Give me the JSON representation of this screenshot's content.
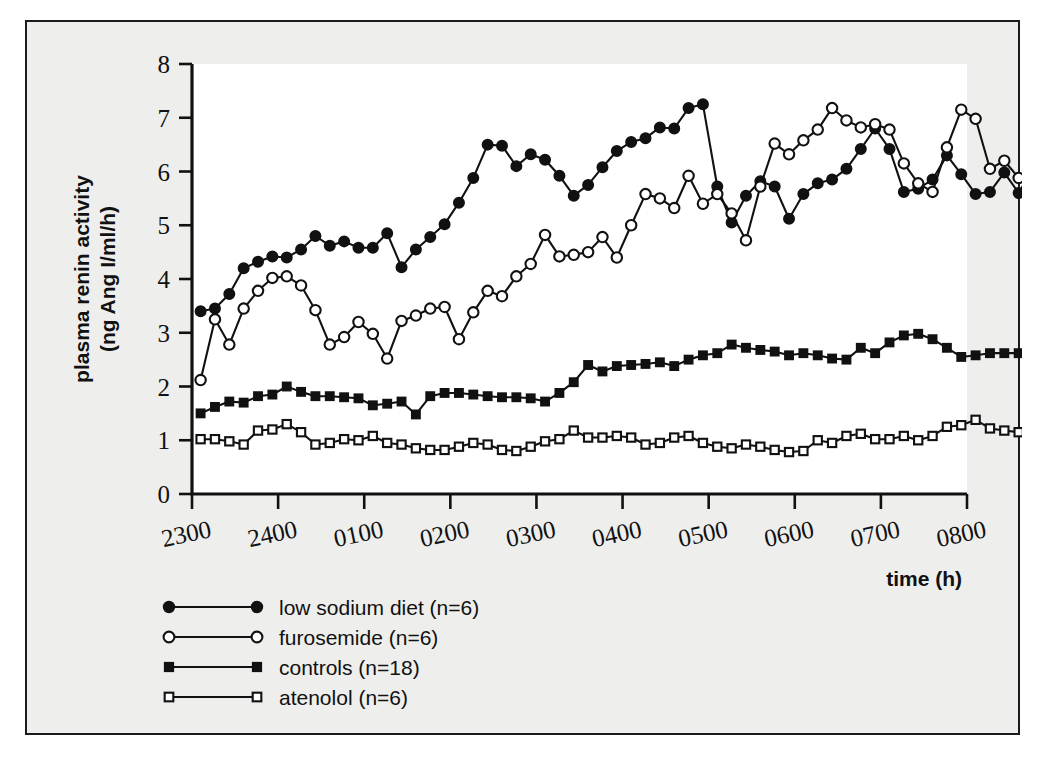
{
  "figure": {
    "background_color": "#eeeeec",
    "plot_background_color": "#ffffff",
    "border_color": "#1b1b1b",
    "ink_color": "#111111"
  },
  "chart_data": {
    "type": "line",
    "title": "",
    "xlabel": "time (h)",
    "ylabel": "plasma renin activity\n(ng Ang I/ml/h)",
    "ylabel_line1": "plasma renin activity",
    "ylabel_line2": "(ng Ang I/ml/h)",
    "grid": false,
    "legend_position": "below-left",
    "ylim": [
      0,
      8
    ],
    "yticks": [
      0,
      1,
      2,
      3,
      4,
      5,
      6,
      7,
      8
    ],
    "ytick_labels": [
      "0",
      "1",
      "2",
      "3",
      "4",
      "5",
      "6",
      "7",
      "8"
    ],
    "xlim_hours": [
      0,
      9
    ],
    "xticks_hours": [
      0,
      1,
      2,
      3,
      4,
      5,
      6,
      7,
      8,
      9
    ],
    "xtick_labels": [
      "2300",
      "2400",
      "0100",
      "0200",
      "0300",
      "0400",
      "0500",
      "0600",
      "0700",
      "0800"
    ],
    "x_sample_interval_minutes": 10,
    "x_start_hours": 0.1,
    "series": [
      {
        "name": "low sodium diet (n=6)",
        "marker": "filled-circle",
        "n": 6,
        "values": [
          3.4,
          3.45,
          3.72,
          4.2,
          4.32,
          4.42,
          4.4,
          4.55,
          4.8,
          4.62,
          4.7,
          4.58,
          4.58,
          4.85,
          4.22,
          4.55,
          4.78,
          5.02,
          5.42,
          5.88,
          6.5,
          6.48,
          6.1,
          6.32,
          6.22,
          5.92,
          5.55,
          5.75,
          6.08,
          6.38,
          6.55,
          6.62,
          6.82,
          6.8,
          7.18,
          7.25,
          5.72,
          5.05,
          5.55,
          5.82,
          5.72,
          5.12,
          5.58,
          5.78,
          5.85,
          6.05,
          6.42,
          6.8,
          6.42,
          5.62,
          5.68,
          5.85,
          6.3,
          5.95,
          5.58,
          5.62,
          5.98,
          5.6,
          6.05
        ]
      },
      {
        "name": "furosemide (n=6)",
        "marker": "open-circle",
        "n": 6,
        "values": [
          2.12,
          3.25,
          2.78,
          3.45,
          3.78,
          4.02,
          4.05,
          3.88,
          3.42,
          2.78,
          2.92,
          3.2,
          2.98,
          2.52,
          3.22,
          3.32,
          3.45,
          3.48,
          2.88,
          3.38,
          3.78,
          3.68,
          4.05,
          4.28,
          4.82,
          4.42,
          4.45,
          4.5,
          4.78,
          4.4,
          5.0,
          5.58,
          5.5,
          5.32,
          5.92,
          5.4,
          5.58,
          5.22,
          4.72,
          5.72,
          6.52,
          6.32,
          6.58,
          6.78,
          7.18,
          6.95,
          6.82,
          6.88,
          6.78,
          6.15,
          5.78,
          5.62,
          6.45,
          7.15,
          6.98,
          6.05,
          6.2,
          5.88,
          6.05
        ]
      },
      {
        "name": "controls (n=18)",
        "marker": "filled-square",
        "n": 18,
        "values": [
          1.5,
          1.62,
          1.72,
          1.7,
          1.82,
          1.85,
          2.0,
          1.9,
          1.82,
          1.82,
          1.8,
          1.78,
          1.65,
          1.68,
          1.72,
          1.48,
          1.82,
          1.88,
          1.88,
          1.85,
          1.82,
          1.8,
          1.8,
          1.78,
          1.72,
          1.88,
          2.08,
          2.4,
          2.28,
          2.38,
          2.4,
          2.42,
          2.45,
          2.38,
          2.5,
          2.58,
          2.62,
          2.78,
          2.72,
          2.68,
          2.65,
          2.58,
          2.62,
          2.58,
          2.52,
          2.5,
          2.72,
          2.62,
          2.82,
          2.95,
          2.98,
          2.88,
          2.72,
          2.55,
          2.58,
          2.62,
          2.62,
          2.62,
          2.55
        ]
      },
      {
        "name": "atenolol (n=6)",
        "marker": "open-square",
        "n": 6,
        "values": [
          1.02,
          1.02,
          0.98,
          0.92,
          1.18,
          1.2,
          1.3,
          1.15,
          0.92,
          0.95,
          1.02,
          1.0,
          1.08,
          0.95,
          0.92,
          0.85,
          0.82,
          0.82,
          0.88,
          0.95,
          0.92,
          0.82,
          0.8,
          0.88,
          0.98,
          1.02,
          1.18,
          1.05,
          1.05,
          1.08,
          1.05,
          0.92,
          0.95,
          1.05,
          1.08,
          0.95,
          0.88,
          0.85,
          0.92,
          0.88,
          0.82,
          0.78,
          0.8,
          1.0,
          0.95,
          1.08,
          1.12,
          1.02,
          1.02,
          1.08,
          1.0,
          1.08,
          1.25,
          1.28,
          1.38,
          1.22,
          1.18,
          1.15,
          1.15
        ]
      }
    ]
  },
  "legend": {
    "entries": [
      {
        "label": "low sodium diet (n=6)",
        "marker": "filled-circle"
      },
      {
        "label": "furosemide (n=6)",
        "marker": "open-circle"
      },
      {
        "label": "controls (n=18)",
        "marker": "filled-square"
      },
      {
        "label": "atenolol (n=6)",
        "marker": "open-square"
      }
    ]
  }
}
